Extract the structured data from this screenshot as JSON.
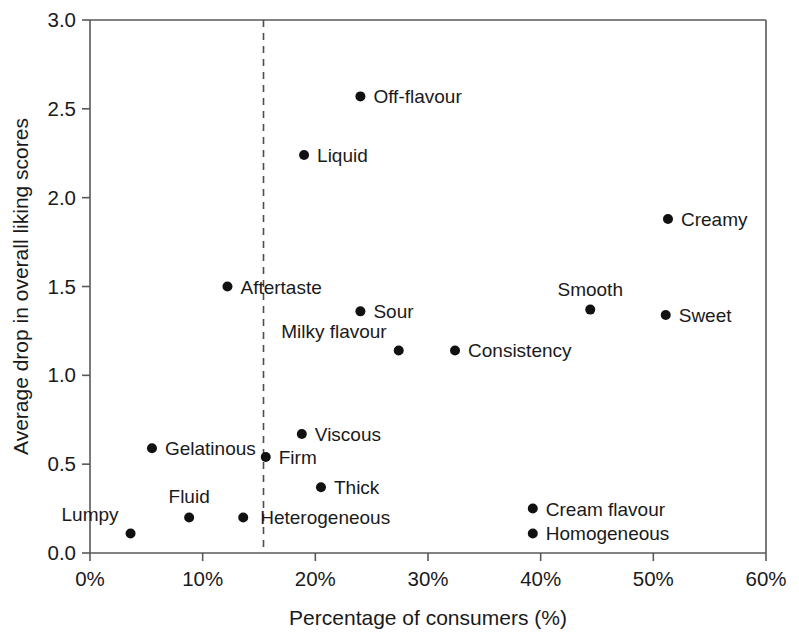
{
  "chart_data": {
    "type": "scatter",
    "title": "",
    "xlabel": "Percentage of consumers (%)",
    "ylabel": "Average drop in overall liking scores",
    "xlim": [
      0,
      60
    ],
    "ylim": [
      0,
      3.0
    ],
    "x_ticks": [
      0,
      10,
      20,
      30,
      40,
      50,
      60
    ],
    "x_tick_labels": [
      "0%",
      "10%",
      "20%",
      "30%",
      "40%",
      "50%",
      "60%"
    ],
    "y_ticks": [
      0.0,
      0.5,
      1.0,
      1.5,
      2.0,
      2.5,
      3.0
    ],
    "y_tick_labels": [
      "0.0",
      "0.5",
      "1.0",
      "1.5",
      "2.0",
      "2.5",
      "3.0"
    ],
    "grid": false,
    "legend": "none",
    "marker_color": "#111111",
    "axis_color": "#595959",
    "annotations": [
      {
        "name": "threshold-line",
        "type": "vertical-dashed-line",
        "x": 15.4,
        "label": "",
        "color": "#4d4d4d"
      }
    ],
    "points": [
      {
        "label": "Off-flavour",
        "x": 24.0,
        "y": 2.57,
        "label_pos": "right"
      },
      {
        "label": "Liquid",
        "x": 19.0,
        "y": 2.24,
        "label_pos": "right"
      },
      {
        "label": "Creamy",
        "x": 51.3,
        "y": 1.88,
        "label_pos": "right"
      },
      {
        "label": "Aftertaste",
        "x": 12.2,
        "y": 1.5,
        "label_pos": "right"
      },
      {
        "label": "Sour",
        "x": 24.0,
        "y": 1.36,
        "label_pos": "right"
      },
      {
        "label": "Smooth",
        "x": 44.4,
        "y": 1.37,
        "label_pos": "above"
      },
      {
        "label": "Sweet",
        "x": 51.1,
        "y": 1.34,
        "label_pos": "right"
      },
      {
        "label": "Milky flavour",
        "x": 27.4,
        "y": 1.14,
        "label_pos": "upper-left"
      },
      {
        "label": "Consistency",
        "x": 32.4,
        "y": 1.14,
        "label_pos": "right"
      },
      {
        "label": "Viscous",
        "x": 18.8,
        "y": 0.67,
        "label_pos": "right"
      },
      {
        "label": "Gelatinous",
        "x": 5.5,
        "y": 0.59,
        "label_pos": "right"
      },
      {
        "label": "Firm",
        "x": 15.6,
        "y": 0.54,
        "label_pos": "right"
      },
      {
        "label": "Thick",
        "x": 20.5,
        "y": 0.37,
        "label_pos": "right"
      },
      {
        "label": "Cream flavour",
        "x": 39.3,
        "y": 0.25,
        "label_pos": "right"
      },
      {
        "label": "Fluid",
        "x": 8.8,
        "y": 0.2,
        "label_pos": "above"
      },
      {
        "label": "Heterogeneous",
        "x": 13.6,
        "y": 0.2,
        "label_pos": "right-offset"
      },
      {
        "label": "Homogeneous",
        "x": 39.3,
        "y": 0.11,
        "label_pos": "right"
      },
      {
        "label": "Lumpy",
        "x": 3.6,
        "y": 0.11,
        "label_pos": "upper-left"
      }
    ]
  }
}
